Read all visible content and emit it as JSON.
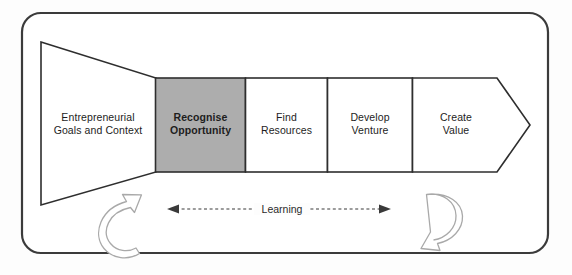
{
  "figure": {
    "name": "entrepreneurial-process-diagram",
    "background_bleed_text": "THE OPPORTUNITY",
    "frame": {
      "border_color": "#3b3b3b",
      "fill_color": "#ffffff"
    },
    "funnel": {
      "label": "Entrepreneurial\nGoals and Context",
      "fill_color": "#ffffff",
      "border_color": "#2e2e2e"
    },
    "stages": [
      {
        "label": "Recognise\nOpportunity",
        "highlighted": true,
        "fill_color": "#adadad",
        "text_weight": "bold"
      },
      {
        "label": "Find\nResources",
        "highlighted": false,
        "fill_color": "#ffffff",
        "text_weight": "normal"
      },
      {
        "label": "Develop\nVenture",
        "highlighted": false,
        "fill_color": "#ffffff",
        "text_weight": "normal"
      },
      {
        "label": "Create\nValue",
        "highlighted": false,
        "fill_color": "#ffffff",
        "text_weight": "normal"
      }
    ],
    "learning_arrow": {
      "label": "Learning",
      "style": "dashed-double-headed",
      "color": "#3a3a3a"
    },
    "feedback_arrows": [
      {
        "name": "left-feedback-arrow",
        "direction": "counter-clockwise-up",
        "color": "#a9a9a9"
      },
      {
        "name": "right-feedback-arrow",
        "direction": "clockwise-down",
        "color": "#a9a9a9"
      }
    ]
  }
}
